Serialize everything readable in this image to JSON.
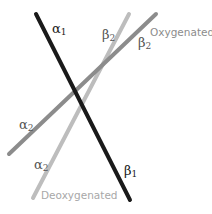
{
  "diagram": {
    "colors": {
      "alpha1_beta1": "#1a1a1a",
      "oxygenated_alpha2_beta2": "#8c8c8c",
      "deoxygenated_alpha2_beta2": "#bdbdbd",
      "oxygenated_label": "#8c8c8c",
      "deoxygenated_label": "#a8a8a8"
    },
    "lines": [
      {
        "id": "alpha1-beta1",
        "x1": 36,
        "y1": 14,
        "x2": 130,
        "y2": 200
      },
      {
        "id": "oxygenated-alpha2-beta2",
        "x1": 9,
        "y1": 154,
        "x2": 156,
        "y2": 14
      },
      {
        "id": "deoxygenated-alpha2-beta2",
        "x1": 33,
        "y1": 198,
        "x2": 129,
        "y2": 14
      }
    ],
    "labels": {
      "alpha1": {
        "base": "α",
        "sub": "1"
      },
      "beta1": {
        "base": "β",
        "sub": "1"
      },
      "beta2_deoxy": {
        "base": "β",
        "sub": "2"
      },
      "beta2_oxy": {
        "base": "β",
        "sub": "2"
      },
      "alpha2_oxy": {
        "base": "α",
        "sub": "2"
      },
      "alpha2_deoxy": {
        "base": "α",
        "sub": "2"
      }
    },
    "states": {
      "oxygenated": "Oxygenated",
      "deoxygenated": "Deoxygenated"
    }
  }
}
